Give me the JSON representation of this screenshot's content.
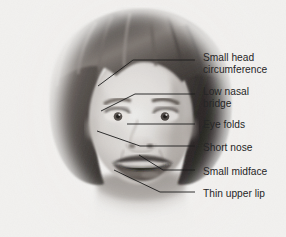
{
  "figure": {
    "kind": "annotated-photograph",
    "background_color": "#f3f2f0",
    "text_color": "#262626",
    "leader_line_color": "#1c1c1c"
  },
  "annotations": [
    {
      "id": "small-head-circumference",
      "label": "Small head\ncircumference",
      "text_x": 203,
      "text_y": 52,
      "leader": "M195,60 L133,60 L98,86"
    },
    {
      "id": "low-nasal-bridge",
      "label": "Low nasal\nbridge",
      "text_x": 203,
      "text_y": 86,
      "leader": "M195,94 L135,94 L101,111"
    },
    {
      "id": "eye-folds",
      "label": "Eye folds",
      "text_x": 203,
      "text_y": 119,
      "leader": "M195,124 L127,124"
    },
    {
      "id": "short-nose",
      "label": "Short nose",
      "text_x": 203,
      "text_y": 142,
      "leader": "M195,146 L140,146 L97,131"
    },
    {
      "id": "small-midface",
      "label": "Small midface",
      "text_x": 203,
      "text_y": 166,
      "leader": "M195,170 L163,170 L139,155"
    },
    {
      "id": "thin-upper-lip",
      "label": "Thin upper lip",
      "text_x": 203,
      "text_y": 188,
      "leader": "M195,192 L160,192 L114,170"
    }
  ]
}
